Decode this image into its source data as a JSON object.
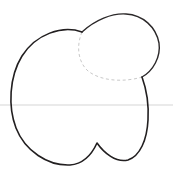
{
  "figure": {
    "canvas": {
      "width": 173,
      "height": 180,
      "background": "#ffffff"
    },
    "caption": "",
    "colors": {
      "ink": "#221f20",
      "construction_dashed": "#c9c9c9",
      "guide_line": "#e3e3e3",
      "background": "#ffffff"
    },
    "elements": [
      {
        "name": "peach-body-outline",
        "kind": "closed-curve",
        "stroke": "#221f20",
        "style": "solid",
        "description": "Large rounded body with a notch at the bottom center",
        "path": "M 82 32 C 62 25 36 34 22 56 C 9 77 8 107 16 128 C 25 151 48 166 70 165 C 83 164 92 154 97 143 C 104 153 116 163 128 160 C 140 156 147 140 148 120 C 149 103 146 88 142 77"
      },
      {
        "name": "peach-top-circle-outline",
        "kind": "closed-curve",
        "stroke": "#221f20",
        "style": "solid",
        "description": "Smaller circular lobe overlapping the upper right of the body",
        "path": "M 82 32 C 95 20 112 13 126 14 C 143 15 156 27 159 43 C 161 57 153 71 142 77"
      },
      {
        "name": "hidden-edge-dashed-arc",
        "kind": "open-curve",
        "stroke": "#c9c9c9",
        "style": "dashed",
        "description": "Dashed construction arc marking the hidden edge of the circle inside the body",
        "path": "M 82 32 C 76 46 78 62 88 71 C 102 82 126 82 142 77"
      },
      {
        "name": "horizontal-guide-line",
        "kind": "line",
        "stroke": "#e3e3e3",
        "style": "solid",
        "description": "Faint full-width horizontal guide line",
        "x1": 0,
        "y1": 105,
        "x2": 173,
        "y2": 105
      }
    ]
  }
}
